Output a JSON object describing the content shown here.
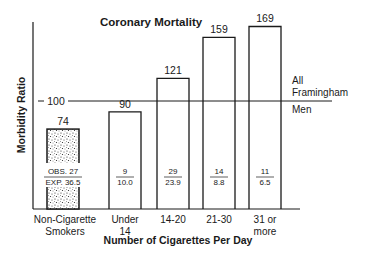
{
  "chart_data": {
    "type": "bar",
    "title": "Coronary Mortality",
    "xlabel": "Number of Cigarettes Per Day",
    "ylabel": "Morbidity Ratio",
    "ylim": [
      0,
      175
    ],
    "grid": false,
    "categories": [
      "Non-Cigarette Smokers",
      "Under 14",
      "14-20",
      "21-30",
      "31 or more"
    ],
    "category_lines": [
      [
        "Non-Cigarette",
        "Smokers"
      ],
      [
        "Under",
        "14"
      ],
      [
        "14-20"
      ],
      [
        "21-30"
      ],
      [
        "31 or",
        "more"
      ]
    ],
    "values": [
      74,
      90,
      121,
      159,
      169
    ],
    "observed": [
      "27",
      "9",
      "29",
      "14",
      "11"
    ],
    "expected": [
      "36.5",
      "10.0",
      "23.9",
      "8.8",
      "6.5"
    ],
    "obs_exp_prefix": {
      "obs": "OBS. ",
      "exp": "EXP. "
    },
    "reference_line": {
      "value": 100,
      "label": "100",
      "annotation": [
        "All",
        "Framingham",
        "Men"
      ]
    },
    "shaded_category": "Non-Cigarette Smokers"
  },
  "colors": {
    "ink": "#1a1a1a",
    "background": "#ffffff"
  }
}
